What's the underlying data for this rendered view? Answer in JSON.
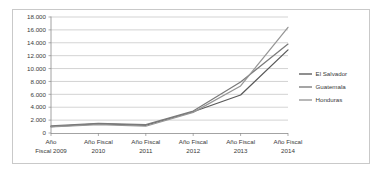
{
  "chart_data": {
    "type": "line",
    "title": "",
    "subtitle": "",
    "xlabel": "",
    "ylabel": "",
    "categories": [
      "Año Fiscal 2009",
      "Año Fiscal 2010",
      "Año Fiscal 2011",
      "Año Fiscal 2012",
      "Año Fiscal 2013",
      "Año Fiscal 2014"
    ],
    "category_lines": [
      [
        "Año",
        "Fiscal 2009"
      ],
      [
        "Año Fiscal",
        "2010"
      ],
      [
        "Año Fiscal",
        "2011"
      ],
      [
        "Año Fiscal",
        "2012"
      ],
      [
        "Año Fiscal",
        "2013"
      ],
      [
        "Año Fiscal",
        "2014"
      ]
    ],
    "series": [
      {
        "name": "El Salvador",
        "color": "#595959",
        "values": [
          1000,
          1400,
          1200,
          3300,
          5900,
          12900
        ]
      },
      {
        "name": "Guatemala",
        "color": "#7a7a7a",
        "values": [
          1100,
          1500,
          1300,
          3400,
          7900,
          13800
        ]
      },
      {
        "name": "Honduras",
        "color": "#969696",
        "values": [
          950,
          1300,
          1050,
          3200,
          7300,
          16400
        ]
      }
    ],
    "ylim": [
      0,
      18000
    ],
    "ytick_values": [
      0,
      2000,
      4000,
      6000,
      8000,
      10000,
      12000,
      14000,
      16000,
      18000
    ],
    "ytick_labels": [
      "0",
      "2.000",
      "4.000",
      "6.000",
      "8.000",
      "10.000",
      "12.000",
      "14.000",
      "16.000",
      "18.000"
    ],
    "grid": true,
    "grid_axis": "y",
    "legend_position": "right",
    "legend_entries": [
      "El Salvador",
      "Guatemala",
      "Honduras"
    ],
    "background_color": "#ffffff",
    "border_color": "#c9c9c9",
    "gridline_color": "#b5b5b5"
  }
}
